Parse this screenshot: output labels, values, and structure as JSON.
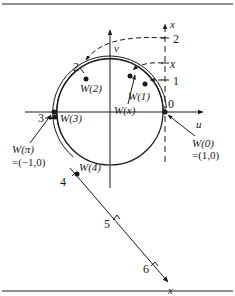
{
  "figure": {
    "colors": {
      "ink": "#1a1a1a",
      "frame": "#555555",
      "background": "#ffffff"
    },
    "axes": {
      "u_label": "u",
      "v_label": "v",
      "x_label_vertical": "x",
      "x_label_tangent": "x"
    },
    "vertical_number_line_ticks": [
      {
        "label": "0"
      },
      {
        "label": "1"
      },
      {
        "label": "x",
        "italic": true
      },
      {
        "label": "2"
      }
    ],
    "circle_number_labels": [
      {
        "label": "2"
      },
      {
        "label": "3"
      },
      {
        "label": "4"
      }
    ],
    "tangent_line_ticks": [
      {
        "label": "5"
      },
      {
        "label": "6"
      }
    ],
    "points": {
      "w0": "W(0)",
      "w0_coords": "=(1,0)",
      "w1": "W(1)",
      "wx": "W(x)",
      "w2": "W(2)",
      "w3": "W(3)",
      "wpi": "W(π)",
      "wpi_coords": "=(−1,0)",
      "w4": "W(4)"
    }
  }
}
